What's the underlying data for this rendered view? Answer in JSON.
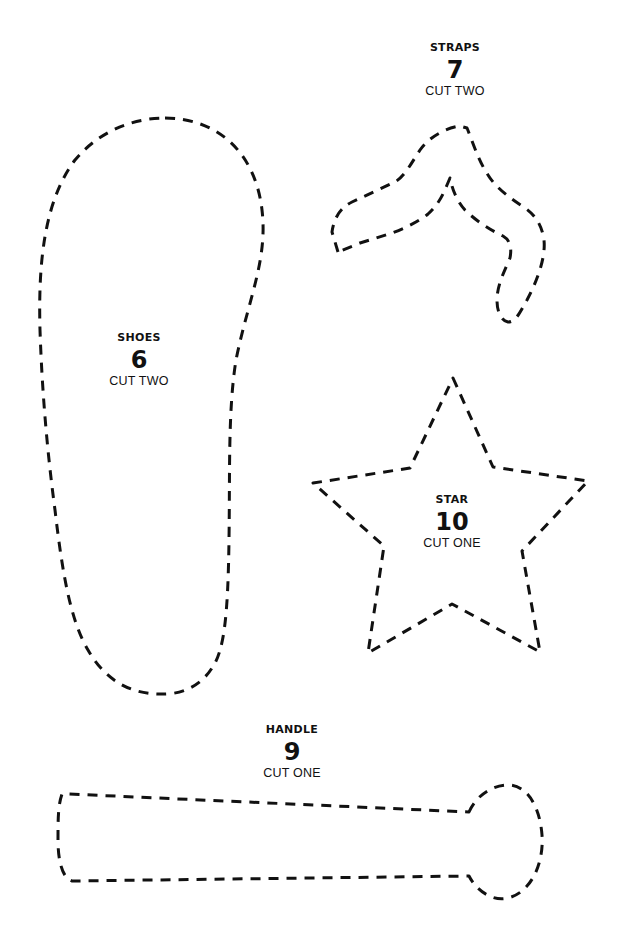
{
  "page": {
    "line_color": "#111111",
    "background": "#ffffff"
  },
  "pieces": [
    {
      "id": "straps",
      "name": "STRAPS",
      "number": "7",
      "quantity": "CUT TWO"
    },
    {
      "id": "shoes",
      "name": "SHOES",
      "number": "6",
      "quantity": "CUT TWO"
    },
    {
      "id": "star",
      "name": "STAR",
      "number": "10",
      "quantity": "CUT ONE"
    },
    {
      "id": "handle",
      "name": "HANDLE",
      "number": "9",
      "quantity": "CUT ONE"
    }
  ]
}
